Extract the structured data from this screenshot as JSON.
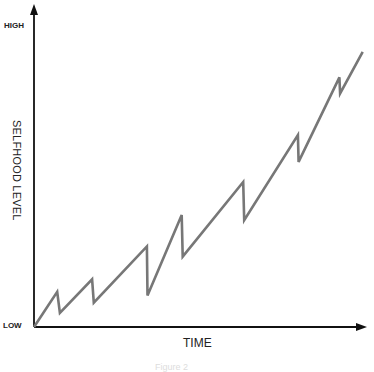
{
  "chart_data": {
    "type": "line",
    "title": "",
    "xlabel": "TIME",
    "ylabel": "SELFHOOD LEVEL",
    "y_tick_labels": {
      "top": "HIGH",
      "bottom": "LOW"
    },
    "grid": false,
    "legend": null,
    "caption": "Figure 2",
    "x": [
      0,
      0.07,
      0.078,
      0.175,
      0.18,
      0.34,
      0.342,
      0.445,
      0.448,
      0.63,
      0.633,
      0.795,
      0.797,
      0.92,
      0.922,
      0.99
    ],
    "values": [
      0,
      0.11,
      0.044,
      0.149,
      0.076,
      0.252,
      0.098,
      0.35,
      0.22,
      0.453,
      0.334,
      0.6,
      0.516,
      0.78,
      0.73,
      0.86
    ]
  },
  "colors": {
    "axis": "#111111",
    "line": "#777777"
  }
}
